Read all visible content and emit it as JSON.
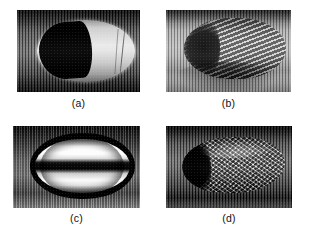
{
  "figure": {
    "background_color": "#ffffff",
    "layout": "2x2 grid of grayscale micrograph panels with centered captions",
    "panels": [
      {
        "id": "a",
        "caption": "(a)",
        "description": "dark machined bullet nose with bright elliptical band and black lobe",
        "x": 17,
        "y": 10,
        "width": 123,
        "height": 82,
        "caption_center_x": 78,
        "caption_y": 97
      },
      {
        "id": "b",
        "caption": "(b)",
        "description": "light surface with fine vertical striations and diagonal stripes across elliptical crater",
        "x": 166,
        "y": 10,
        "width": 125,
        "height": 82,
        "caption_center_x": 228,
        "caption_y": 97
      },
      {
        "id": "c",
        "caption": "(c)",
        "description": "dark elliptical ring with bright horizontal bands split by a dark central band",
        "x": 13,
        "y": 126,
        "width": 127,
        "height": 82,
        "caption_center_x": 76,
        "caption_y": 212
      },
      {
        "id": "d",
        "caption": "(d)",
        "description": "dark field with bright elliptical region filled with chevron crosshatch weave texture",
        "x": 166,
        "y": 126,
        "width": 126,
        "height": 82,
        "caption_center_x": 228,
        "caption_y": 212
      }
    ]
  }
}
